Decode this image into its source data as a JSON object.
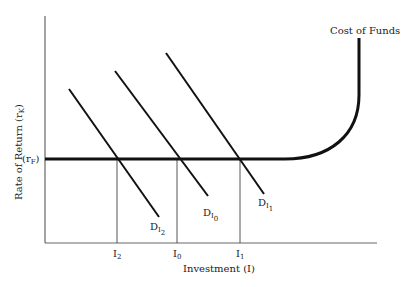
{
  "diagram": {
    "title": "",
    "y_axis_label": "Rate of Return (r",
    "y_axis_label_sub": "K",
    "y_axis_label_close": ")",
    "x_axis_label": "Investment (I)",
    "r_label": "(r",
    "r_label_sub": "F",
    "r_label_close": ")",
    "cost_of_funds_label": "Cost of Funds",
    "demand_curves": [
      {
        "label": "D",
        "sub1": "I",
        "sub2": "2"
      },
      {
        "label": "D",
        "sub1": "I",
        "sub2": "0"
      },
      {
        "label": "D",
        "sub1": "I",
        "sub2": "1"
      }
    ],
    "x_ticks": [
      {
        "label": "I",
        "sub": "2"
      },
      {
        "label": "I",
        "sub": "0"
      },
      {
        "label": "I",
        "sub": "1"
      }
    ]
  }
}
